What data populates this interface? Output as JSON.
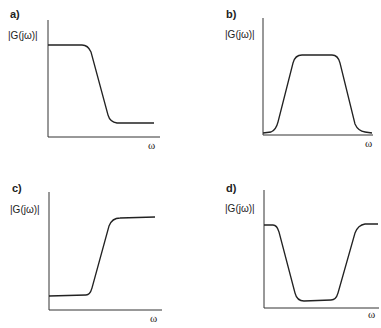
{
  "panels": [
    {
      "id": "a",
      "label": "a)",
      "ylabel": "|G(jω)|",
      "xlabel": "ω",
      "type": "low-pass"
    },
    {
      "id": "b",
      "label": "b)",
      "ylabel": "|G(jω)|",
      "xlabel": "ω",
      "type": "band-pass"
    },
    {
      "id": "c",
      "label": "c)",
      "ylabel": "|G(jω)|",
      "xlabel": "ω",
      "type": "high-pass"
    },
    {
      "id": "d",
      "label": "d)",
      "ylabel": "|G(jω)|",
      "xlabel": "ω",
      "type": "band-stop"
    }
  ],
  "colors": {
    "line": "#222222",
    "background": "#ffffff"
  }
}
